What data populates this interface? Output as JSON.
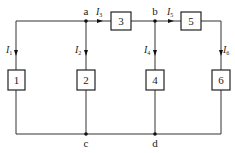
{
  "diagram": {
    "type": "circuit",
    "nodes": [
      {
        "id": "a",
        "label": "a"
      },
      {
        "id": "b",
        "label": "b"
      },
      {
        "id": "c",
        "label": "c"
      },
      {
        "id": "d",
        "label": "d"
      }
    ],
    "elements": [
      {
        "id": "1",
        "label": "1"
      },
      {
        "id": "2",
        "label": "2"
      },
      {
        "id": "3",
        "label": "3"
      },
      {
        "id": "4",
        "label": "4"
      },
      {
        "id": "5",
        "label": "5"
      },
      {
        "id": "6",
        "label": "6"
      }
    ],
    "currents": [
      {
        "symbol": "I",
        "sub": "1",
        "branch": "element 1"
      },
      {
        "symbol": "I",
        "sub": "2",
        "branch": "element 2"
      },
      {
        "symbol": "I",
        "sub": "3",
        "branch": "element 3"
      },
      {
        "symbol": "I",
        "sub": "4",
        "branch": "element 4"
      },
      {
        "symbol": "I",
        "sub": "5",
        "branch": "element 5"
      },
      {
        "symbol": "I",
        "sub": "6",
        "branch": "element 6"
      }
    ]
  }
}
